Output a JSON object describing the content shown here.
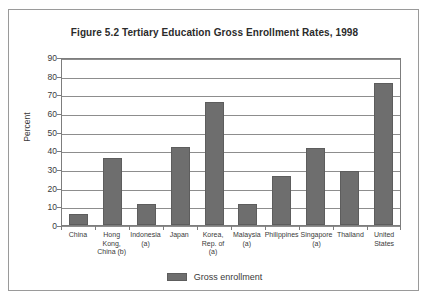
{
  "figure": {
    "title": "Figure 5.2 Tertiary Education Gross Enrollment Rates, 1998"
  },
  "colors": {
    "bar_fill": "#6e6e6e",
    "bar_stroke": "#5d5d5d",
    "gridline": "#8d8d8d",
    "frame": "#7d7d7d",
    "outer_border": "#9a9a9a",
    "text": "#3a3a3a"
  },
  "legend": {
    "position": "bottom-center",
    "label": "Gross enrollment",
    "swatch": "legend-swatch-gross-enrollment"
  },
  "chart_data": {
    "type": "bar",
    "title": "Figure 5.2 Tertiary Education Gross Enrollment Rates, 1998",
    "xlabel": "",
    "ylabel": "Percent",
    "ylim": [
      0,
      90
    ],
    "ytick_step": 10,
    "yticks": [
      0,
      10,
      20,
      30,
      40,
      50,
      60,
      70,
      80,
      90
    ],
    "ytick_labels": [
      "0",
      "10",
      "20",
      "30",
      "40",
      "50",
      "60",
      "70",
      "80",
      "90"
    ],
    "grid": true,
    "grid_axis": "y",
    "legend_position": "bottom",
    "categories": [
      "China",
      "Hong Kong, China (b)",
      "Indonesia (a)",
      "Japan",
      "Korea, Rep. of (a)",
      "Malaysia (a)",
      "Philippines",
      "Singapore (a)",
      "Thailand",
      "United States"
    ],
    "category_lines": [
      [
        "China"
      ],
      [
        "Hong",
        "Kong,",
        "China (b)"
      ],
      [
        "Indonesia",
        "(a)"
      ],
      [
        "Japan"
      ],
      [
        "Korea,",
        "Rep. of (a)"
      ],
      [
        "Malaysia",
        "(a)"
      ],
      [
        "Philippines"
      ],
      [
        "Singapore",
        "(a)"
      ],
      [
        "Thailand"
      ],
      [
        "United",
        "States"
      ]
    ],
    "series": [
      {
        "name": "Gross enrollment",
        "values": [
          6,
          36,
          11,
          42,
          66,
          11,
          26,
          41,
          29,
          76
        ]
      }
    ]
  }
}
